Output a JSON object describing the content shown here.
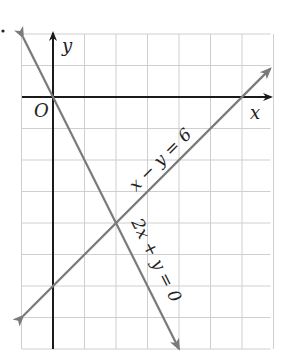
{
  "diagram": {
    "type": "coordinate-graph",
    "origin_label": "O",
    "x_axis_label": "x",
    "y_axis_label": "y",
    "grid": {
      "x_min": -1,
      "x_max": 7,
      "y_min": -8,
      "y_max": 2,
      "step": 1
    },
    "colors": {
      "axis": "#1a1a1a",
      "line": "#7a7a7a",
      "grid": "#cfcfcf"
    },
    "lines": [
      {
        "equation": "x − y = 6",
        "from": [
          -0.95,
          -6.95
        ],
        "to": [
          6.9,
          0.9
        ]
      },
      {
        "equation": "2x + y = 0",
        "from": [
          -0.95,
          1.9
        ],
        "to": [
          4,
          -8
        ]
      }
    ],
    "intersection": {
      "x": 2,
      "y": -4
    }
  }
}
